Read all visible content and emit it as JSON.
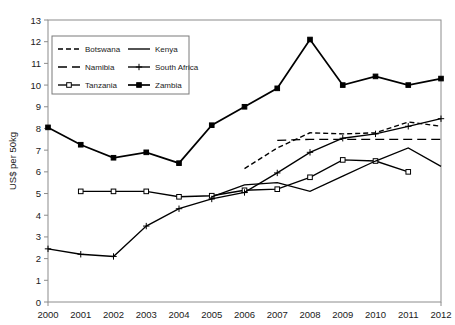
{
  "chart_data": {
    "type": "line",
    "title": "",
    "xlabel": "",
    "ylabel": "US$ per 50kg",
    "ylim": [
      0,
      13
    ],
    "ytick_step": 1,
    "grid": false,
    "legend_position": "top-left-inside",
    "categories": [
      "2000",
      "2001",
      "2002",
      "2003",
      "2004",
      "2005",
      "2006",
      "2007",
      "2008",
      "2009",
      "2010",
      "2011",
      "2012"
    ],
    "series": [
      {
        "name": "Botswana",
        "style": "dashed-short",
        "marker": "none",
        "color": "#000000",
        "values": [
          null,
          null,
          null,
          null,
          null,
          null,
          6.15,
          7.1,
          7.8,
          7.75,
          7.8,
          8.3,
          8.1
        ]
      },
      {
        "name": "Namibia",
        "style": "dashed-long",
        "marker": "none",
        "color": "#000000",
        "values": [
          null,
          null,
          null,
          null,
          null,
          null,
          null,
          7.45,
          7.5,
          7.5,
          7.5,
          7.5,
          7.5
        ]
      },
      {
        "name": "Tanzania",
        "style": "solid",
        "marker": "square-open",
        "color": "#000000",
        "values": [
          null,
          5.1,
          5.1,
          5.1,
          4.85,
          4.9,
          5.15,
          5.2,
          5.75,
          6.55,
          6.5,
          6.0,
          null
        ]
      },
      {
        "name": "Kenya",
        "style": "solid",
        "marker": "none",
        "color": "#000000",
        "values": [
          null,
          null,
          null,
          null,
          null,
          4.85,
          5.4,
          5.5,
          5.1,
          5.8,
          6.5,
          7.1,
          6.25
        ]
      },
      {
        "name": "South Africa",
        "style": "solid",
        "marker": "plus",
        "color": "#000000",
        "values": [
          2.45,
          2.2,
          2.1,
          3.5,
          4.3,
          4.75,
          5.05,
          5.95,
          6.9,
          7.55,
          7.75,
          8.1,
          8.45
        ]
      },
      {
        "name": "Zambia",
        "style": "solid",
        "marker": "square-filled",
        "color": "#000000",
        "values": [
          8.05,
          7.25,
          6.65,
          6.9,
          6.4,
          8.15,
          9.0,
          9.85,
          12.1,
          10.0,
          10.4,
          10.0,
          10.3
        ]
      }
    ],
    "ytick_labels": [
      "0",
      "1",
      "2",
      "3",
      "4",
      "5",
      "6",
      "7",
      "8",
      "9",
      "10",
      "11",
      "12",
      "13"
    ]
  },
  "legend": {
    "items": [
      {
        "label": "Botswana"
      },
      {
        "label": "Kenya"
      },
      {
        "label": "Namibia"
      },
      {
        "label": "South Africa"
      },
      {
        "label": "Tanzania"
      },
      {
        "label": "Zambia"
      }
    ]
  }
}
